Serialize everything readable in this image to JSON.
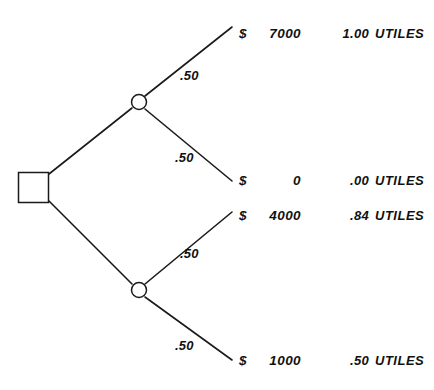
{
  "diagram": {
    "type": "decision-tree",
    "nodes": {
      "decision": {
        "shape": "square",
        "x": 33,
        "y": 187
      },
      "chance_upper": {
        "shape": "circle",
        "x": 139,
        "y": 102
      },
      "chance_lower": {
        "shape": "circle",
        "x": 139,
        "y": 290
      }
    },
    "branches": [
      {
        "id": "upper-win",
        "probability": ".50",
        "label_x": 180,
        "label_y": 68
      },
      {
        "id": "upper-lose",
        "probability": ".50",
        "label_x": 175,
        "label_y": 150
      },
      {
        "id": "lower-win",
        "probability": ".50",
        "label_x": 180,
        "label_y": 246
      },
      {
        "id": "lower-lose",
        "probability": ".50",
        "label_x": 175,
        "label_y": 338
      }
    ],
    "outcomes": [
      {
        "id": "outcome-7000",
        "currency": "$",
        "amount": "7000",
        "utility": "1.00",
        "unit": "UTILES",
        "row_y": 26
      },
      {
        "id": "outcome-0",
        "currency": "$",
        "amount": "0",
        "utility": ".00",
        "unit": "UTILES",
        "row_y": 173
      },
      {
        "id": "outcome-4000",
        "currency": "$",
        "amount": "4000",
        "utility": ".84",
        "unit": "UTILES",
        "row_y": 208
      },
      {
        "id": "outcome-1000",
        "currency": "$",
        "amount": "1000",
        "utility": ".50",
        "unit": "UTILES",
        "row_y": 353
      }
    ],
    "colors": {
      "ink": "#1a1a1a",
      "background": "#ffffff"
    }
  }
}
